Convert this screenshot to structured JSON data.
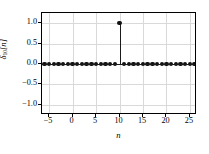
{
  "figure": {
    "background_color": "#ffffff",
    "axes_frame_color": "#000000",
    "grid_color": "#d9d9d9",
    "marker_color": "#111111",
    "stem_color": "#1a1a1a"
  },
  "chart_data": {
    "type": "scatter",
    "plot_style": "stem",
    "title": "",
    "xlabel": "n",
    "ylabel": "δ₁₀[n]",
    "ylabel_symbol": "δ",
    "ylabel_subscript": "10",
    "ylabel_argument": "[n]",
    "xlim": [
      -6.5,
      26.5
    ],
    "ylim": [
      -1.25,
      1.25
    ],
    "xticks": [
      -5,
      0,
      5,
      10,
      15,
      20,
      25
    ],
    "xticklabels": [
      "−5",
      "0",
      "5",
      "10",
      "15",
      "20",
      "25"
    ],
    "yticks": [
      -1.0,
      -0.5,
      0.0,
      0.5,
      1.0
    ],
    "yticklabels": [
      "−1.0",
      "−0.5",
      "0.0",
      "0.5",
      "1.0"
    ],
    "grid": true,
    "legend": null,
    "impulse_location": 10,
    "impulse_amplitude": 1.0,
    "x": [
      -6,
      -5,
      -4,
      -3,
      -2,
      -1,
      0,
      1,
      2,
      3,
      4,
      5,
      6,
      7,
      8,
      9,
      10,
      11,
      12,
      13,
      14,
      15,
      16,
      17,
      18,
      19,
      20,
      21,
      22,
      23,
      24,
      25,
      26
    ],
    "values": [
      0,
      0,
      0,
      0,
      0,
      0,
      0,
      0,
      0,
      0,
      0,
      0,
      0,
      0,
      0,
      0,
      1,
      0,
      0,
      0,
      0,
      0,
      0,
      0,
      0,
      0,
      0,
      0,
      0,
      0,
      0,
      0,
      0
    ]
  }
}
